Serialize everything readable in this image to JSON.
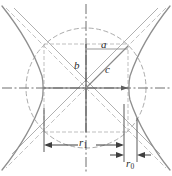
{
  "figure": {
    "type": "geometry-diagram",
    "width": 172,
    "height": 176,
    "background": "#ffffff",
    "center": {
      "x": 86,
      "y": 88
    },
    "colors": {
      "curve": "#8c8c8c",
      "axis": "#6e6e6e",
      "construction": "#b9b9b9",
      "dimension": "#4a4a4a",
      "label": "#2b2b2b",
      "circle": "#a8a8a8",
      "asymptote": "#bdbdbd"
    },
    "labels": {
      "a": "a",
      "b": "b",
      "c": "c",
      "r1_base": "r",
      "r1_sub": "1",
      "r0_base": "r",
      "r0_sub": "0"
    },
    "geometry": {
      "semi_major_a": 42,
      "semi_minor_b": 44,
      "hypotenuse_c": 60,
      "circle_radius": 60,
      "vertex_left_x": 44,
      "vertex_right_x": 128,
      "rect_top_y": 44,
      "rect_bottom_y": 132,
      "r1_value": 40,
      "r0_value": 13
    },
    "dimensions": [
      {
        "name": "r1",
        "label": "r",
        "subscript": "1",
        "y": 145,
        "x_start": 44,
        "x_end": 124,
        "arrows": "inward"
      },
      {
        "name": "r0",
        "label": "r",
        "subscript": "0",
        "y": 155,
        "x_start": 124,
        "x_end": 137,
        "arrows": "outward"
      }
    ]
  }
}
